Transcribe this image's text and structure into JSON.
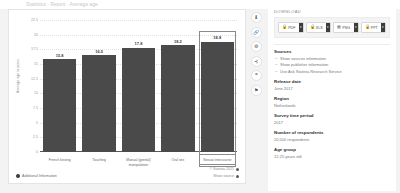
{
  "top_strip": {
    "cutoff_text": "Statistics  ·  Report  ·  Average age"
  },
  "chart_data": {
    "type": "bar",
    "title": "",
    "xlabel": "",
    "ylabel": "Average age in years",
    "categories": [
      "French kissing",
      "Touching",
      "Manual (genital) manipulation",
      "Oral sex",
      "Sexual intercourse"
    ],
    "values": [
      15.8,
      16.5,
      17.8,
      18.2,
      18.8
    ],
    "value_labels": [
      "15.8",
      "16.5",
      "17.8",
      "18.2",
      "18.8"
    ],
    "ylim": [
      0,
      22.5
    ],
    "yticks": [
      22.5,
      20,
      17.5,
      15,
      12.5,
      10,
      7.5,
      5,
      2.5,
      0
    ],
    "ytick_labels": [
      "22.5",
      "20",
      "17.5",
      "15",
      "12.5",
      "10",
      "7.5",
      "5",
      "2.5",
      "0"
    ],
    "grid": true,
    "legend": "none",
    "highlighted_category": "Sexual intercourse",
    "bar_color": "#4a4a4a"
  },
  "chart_footer": {
    "additional_info_label": "Additional Information",
    "copyright": "© Statista 2021",
    "show_source_label": "Show source"
  },
  "icon_rail": {
    "items": [
      {
        "name": "download-icon",
        "glyph": "⬇"
      },
      {
        "name": "link-icon",
        "glyph": "🔗"
      },
      {
        "name": "settings-icon",
        "glyph": "⚙"
      },
      {
        "name": "share-icon",
        "glyph": "⊰"
      },
      {
        "name": "citation-icon",
        "glyph": "❝"
      },
      {
        "name": "bookmark-icon",
        "glyph": "⚑"
      }
    ]
  },
  "side_panel": {
    "download_heading": "DOWNLOAD",
    "download_buttons": [
      {
        "label": "PDF",
        "glyph": "🔒",
        "badge": "▾"
      },
      {
        "label": "XLS",
        "glyph": "🔒",
        "badge": "▾"
      },
      {
        "label": "PNG",
        "glyph": "▦",
        "badge": "▾"
      },
      {
        "label": "PPT",
        "glyph": "🔒",
        "badge": "▾"
      }
    ],
    "sources": {
      "title": "Sources",
      "links": [
        "Show sources information",
        "Show publisher information",
        "Use Ask Statista Research Service"
      ]
    },
    "meta": [
      {
        "title": "Release date",
        "value": "June 2017"
      },
      {
        "title": "Region",
        "value": "Netherlands"
      },
      {
        "title": "Survey time period",
        "value": "2017"
      },
      {
        "title": "Number of respondents",
        "value": "20,500 respondents"
      },
      {
        "title": "Age group",
        "value": "12-25 years old"
      }
    ]
  }
}
